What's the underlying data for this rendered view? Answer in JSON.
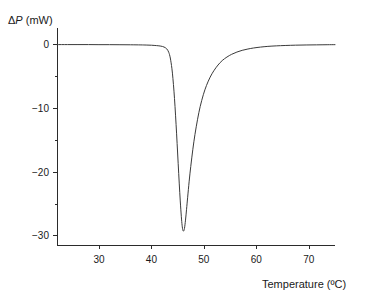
{
  "chart_data": {
    "type": "line",
    "title": "",
    "subtitle": "",
    "xlabel": "Temperature (ºC)",
    "ylabel": "ΔP (mW)",
    "ylabel_delta": "Δ",
    "ylabel_p": "P",
    "ylabel_units": " (mW)",
    "xlim": [
      22,
      75
    ],
    "ylim": [
      -31.5,
      2.5
    ],
    "grid": false,
    "legend": null,
    "legend_position": "none",
    "xticks": [
      30,
      40,
      50,
      60,
      70
    ],
    "xtick_labels": [
      "30",
      "40",
      "50",
      "60",
      "70"
    ],
    "xminor_ticks": [],
    "yticks": [
      0,
      -10,
      -20,
      -30
    ],
    "ytick_labels": [
      "0",
      "−10",
      "−20",
      "−30"
    ],
    "yminor_ticks": [
      -5,
      -15,
      -25,
      5
    ],
    "annotations": [],
    "series": [
      {
        "name": "heat flow",
        "x": [
          22.0,
          24.0,
          26.0,
          28.0,
          30.0,
          32.0,
          34.0,
          36.0,
          38.0,
          39.0,
          40.0,
          41.0,
          41.8,
          42.4,
          42.9,
          43.3,
          43.6,
          43.9,
          44.1,
          44.3,
          44.5,
          44.7,
          44.9,
          45.1,
          45.3,
          45.5,
          45.7,
          45.85,
          46.0,
          46.15,
          46.3,
          46.5,
          46.7,
          46.9,
          47.2,
          47.5,
          47.9,
          48.3,
          48.8,
          49.3,
          49.9,
          50.5,
          51.2,
          51.9,
          52.7,
          53.5,
          54.4,
          55.3,
          56.3,
          57.3,
          58.4,
          59.5,
          60.8,
          62.2,
          63.8,
          65.5,
          67.5,
          69.5,
          71.5,
          73.5,
          75.0
        ],
        "y": [
          -0.1,
          -0.1,
          -0.1,
          -0.1,
          -0.11,
          -0.11,
          -0.12,
          -0.13,
          -0.15,
          -0.17,
          -0.2,
          -0.26,
          -0.34,
          -0.48,
          -0.75,
          -1.3,
          -2.2,
          -3.8,
          -5.4,
          -7.4,
          -9.8,
          -12.6,
          -15.6,
          -18.7,
          -21.8,
          -24.6,
          -27.0,
          -28.4,
          -29.2,
          -29.3,
          -28.9,
          -27.6,
          -25.9,
          -24.1,
          -21.5,
          -19.2,
          -16.5,
          -14.2,
          -11.8,
          -9.8,
          -7.95,
          -6.5,
          -5.2,
          -4.2,
          -3.3,
          -2.6,
          -2.05,
          -1.62,
          -1.27,
          -1.0,
          -0.79,
          -0.63,
          -0.49,
          -0.38,
          -0.3,
          -0.24,
          -0.19,
          -0.16,
          -0.14,
          -0.12,
          -0.11
        ],
        "color": "#3a3a3a",
        "style": "solid",
        "width": 1
      }
    ],
    "peak": {
      "temperature": 45.8,
      "value": -29.3,
      "onset_temperature": 43.5,
      "return_to_baseline_temperature": 59.0
    },
    "baseline_value": -0.1,
    "colors": {
      "curve": "#3a3a3a",
      "axis": "#2b2b2b",
      "text": "#1a1a1a",
      "background": "#ffffff"
    },
    "axes_geometry": {
      "plot_left": 57,
      "plot_right": 335,
      "plot_top": 28,
      "plot_bottom": 245
    }
  }
}
